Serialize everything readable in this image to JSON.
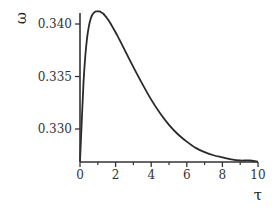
{
  "chart_data": {
    "type": "line",
    "title": "",
    "xlabel": "τ",
    "ylabel": "ω",
    "xlim": [
      0,
      10
    ],
    "ylim": [
      0.3269,
      0.3413
    ],
    "x_ticks": [
      0,
      2,
      4,
      6,
      8,
      10
    ],
    "x_tick_labels": [
      "0",
      "2",
      "4",
      "6",
      "8",
      "10"
    ],
    "x_minor_ticks": [
      1,
      3,
      5,
      7,
      9
    ],
    "y_ticks": [
      0.33,
      0.335,
      0.34
    ],
    "y_tick_labels": [
      "0.330",
      "0.335",
      "0.340"
    ],
    "grid": false,
    "legend": null,
    "series": [
      {
        "name": "ω(τ)",
        "x": [
          0,
          0.1,
          0.2,
          0.3,
          0.4,
          0.5,
          0.6,
          0.7,
          0.8,
          0.9,
          1.0,
          1.1,
          1.2,
          1.3,
          1.4,
          1.5,
          1.7,
          1.9,
          2.1,
          2.4,
          2.7,
          3.0,
          3.5,
          4.0,
          4.5,
          5.0,
          5.5,
          6.0,
          6.5,
          7.0,
          7.5,
          8.0,
          8.5,
          9.0,
          9.5,
          10.0
        ],
        "values": [
          0.3269,
          0.3308,
          0.3345,
          0.337,
          0.3387,
          0.3398,
          0.3405,
          0.3409,
          0.3411,
          0.3412,
          0.3412,
          0.3412,
          0.3411,
          0.341,
          0.3408,
          0.3406,
          0.3401,
          0.3395,
          0.3389,
          0.3379,
          0.3369,
          0.3359,
          0.3343,
          0.3328,
          0.3315,
          0.3304,
          0.3295,
          0.3288,
          0.3282,
          0.3278,
          0.3275,
          0.3273,
          0.3271,
          0.327,
          0.327,
          0.3269
        ]
      }
    ]
  }
}
